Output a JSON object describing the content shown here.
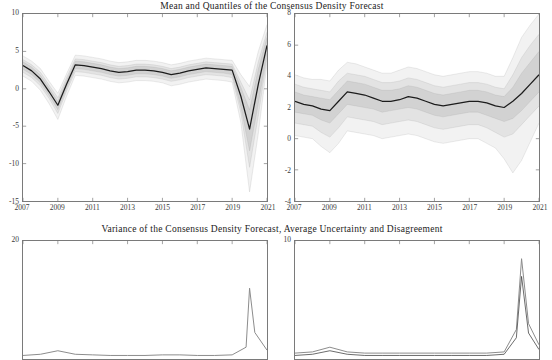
{
  "figure": {
    "title_top": "Mean and Quantiles of the Consensus Density Forecast",
    "title_bottom": "Variance of the Consensus Density Forecast, Average Uncertainty and Disagreement",
    "background": "#ffffff",
    "axis_color": "#7a7a7a",
    "line_color": "#1c1c1c",
    "band_colors": [
      "#f2f2f2",
      "#e3e3e3",
      "#d2d2d2",
      "#bfbfbf",
      "#ababab"
    ]
  },
  "chart_data": [
    {
      "id": "top-left",
      "type": "area",
      "title": "Mean and Quantiles of the Consensus Density Forecast",
      "xlabel": "",
      "ylabel": "",
      "xlim": [
        2007,
        2021
      ],
      "ylim": [
        -15,
        10
      ],
      "yticks": [
        -15,
        -10,
        -5,
        0,
        5,
        10
      ],
      "xticks": [
        2007,
        2009,
        2011,
        2013,
        2015,
        2017,
        2019,
        2021
      ],
      "grid": false,
      "legend": "none",
      "x": [
        2007,
        2007.5,
        2008,
        2008.5,
        2009,
        2009.5,
        2010,
        2010.5,
        2011,
        2011.5,
        2012,
        2012.5,
        2013,
        2013.5,
        2014,
        2014.5,
        2015,
        2015.5,
        2016,
        2016.5,
        2017,
        2017.5,
        2018,
        2018.5,
        2019,
        2019.5,
        2020,
        2020.5,
        2021
      ],
      "series": [
        {
          "name": "mean",
          "values": [
            3.1,
            2.4,
            1.3,
            -0.4,
            -2.2,
            0.6,
            3.2,
            3.1,
            2.9,
            2.7,
            2.4,
            2.2,
            2.3,
            2.5,
            2.5,
            2.4,
            2.2,
            1.9,
            2.1,
            2.4,
            2.6,
            2.8,
            2.7,
            2.6,
            2.5,
            -1.0,
            -5.4,
            0.6,
            5.8
          ]
        },
        {
          "name": "q05",
          "values": [
            1.7,
            1.0,
            -0.2,
            -2.0,
            -4.1,
            -1.0,
            1.8,
            1.7,
            1.5,
            1.3,
            1.0,
            0.8,
            0.9,
            1.1,
            1.1,
            1.0,
            0.8,
            0.4,
            0.6,
            0.9,
            1.1,
            1.3,
            1.2,
            1.1,
            0.9,
            -4.5,
            -13.8,
            -6.0,
            3.3
          ]
        },
        {
          "name": "q15",
          "values": [
            2.2,
            1.5,
            0.4,
            -1.3,
            -3.3,
            -0.3,
            2.3,
            2.2,
            2.0,
            1.8,
            1.5,
            1.3,
            1.4,
            1.6,
            1.6,
            1.5,
            1.3,
            1.0,
            1.2,
            1.5,
            1.7,
            1.9,
            1.8,
            1.7,
            1.5,
            -3.2,
            -10.5,
            -3.6,
            4.1
          ]
        },
        {
          "name": "q25",
          "values": [
            2.6,
            1.9,
            0.8,
            -0.9,
            -2.8,
            0.1,
            2.7,
            2.6,
            2.4,
            2.2,
            1.9,
            1.7,
            1.8,
            2.0,
            2.0,
            1.9,
            1.7,
            1.4,
            1.6,
            1.9,
            2.1,
            2.3,
            2.2,
            2.1,
            1.9,
            -2.4,
            -8.3,
            -2.0,
            4.7
          ]
        },
        {
          "name": "q75",
          "values": [
            3.6,
            2.9,
            1.8,
            0.1,
            -1.7,
            1.1,
            3.7,
            3.6,
            3.4,
            3.2,
            2.9,
            2.7,
            2.8,
            3.0,
            3.0,
            2.9,
            2.7,
            2.4,
            2.6,
            2.9,
            3.1,
            3.3,
            3.2,
            3.1,
            3.0,
            0.2,
            -2.8,
            2.6,
            6.9
          ]
        },
        {
          "name": "q85",
          "values": [
            3.9,
            3.2,
            2.2,
            0.5,
            -1.2,
            1.5,
            4.0,
            3.9,
            3.7,
            3.5,
            3.2,
            3.0,
            3.1,
            3.3,
            3.3,
            3.2,
            3.0,
            2.7,
            2.9,
            3.2,
            3.4,
            3.6,
            3.5,
            3.4,
            3.3,
            0.9,
            -1.5,
            3.6,
            7.6
          ]
        },
        {
          "name": "q95",
          "values": [
            4.4,
            3.7,
            2.7,
            1.0,
            -0.6,
            2.0,
            4.5,
            4.4,
            4.2,
            4.0,
            3.7,
            3.5,
            3.6,
            3.8,
            3.8,
            3.7,
            3.5,
            3.2,
            3.4,
            3.7,
            3.9,
            4.1,
            4.0,
            3.9,
            3.8,
            1.9,
            0.3,
            5.0,
            8.6
          ]
        }
      ]
    },
    {
      "id": "top-right",
      "type": "area",
      "title": "Mean and Quantiles of the Consensus Density Forecast",
      "xlabel": "",
      "ylabel": "",
      "xlim": [
        2007,
        2021
      ],
      "ylim": [
        -4,
        8
      ],
      "yticks": [
        -4,
        -2,
        0,
        2,
        4,
        6,
        8
      ],
      "xticks": [
        2007,
        2009,
        2011,
        2013,
        2015,
        2017,
        2019,
        2021
      ],
      "grid": false,
      "legend": "none",
      "x": [
        2007,
        2007.5,
        2008,
        2008.5,
        2009,
        2009.5,
        2010,
        2010.5,
        2011,
        2011.5,
        2012,
        2012.5,
        2013,
        2013.5,
        2014,
        2014.5,
        2015,
        2015.5,
        2016,
        2016.5,
        2017,
        2017.5,
        2018,
        2018.5,
        2019,
        2019.5,
        2020,
        2020.5,
        2021
      ],
      "series": [
        {
          "name": "mean",
          "values": [
            2.4,
            2.2,
            2.1,
            1.9,
            1.8,
            2.4,
            3.0,
            2.9,
            2.8,
            2.6,
            2.4,
            2.4,
            2.5,
            2.7,
            2.6,
            2.4,
            2.2,
            2.1,
            2.2,
            2.3,
            2.4,
            2.4,
            2.3,
            2.1,
            2.0,
            2.4,
            2.9,
            3.5,
            4.1
          ]
        },
        {
          "name": "q05",
          "values": [
            0.2,
            0.1,
            0.0,
            -0.5,
            -0.9,
            -0.3,
            0.5,
            0.4,
            0.3,
            0.2,
            0.0,
            0.1,
            0.2,
            0.3,
            0.2,
            0.0,
            -0.2,
            -0.3,
            -0.2,
            -0.1,
            0.0,
            0.0,
            -0.3,
            -0.6,
            -1.3,
            -2.2,
            -1.4,
            -0.2,
            1.0
          ]
        },
        {
          "name": "q15",
          "values": [
            1.0,
            0.9,
            0.8,
            0.4,
            0.1,
            0.7,
            1.4,
            1.3,
            1.2,
            1.1,
            0.9,
            1.0,
            1.1,
            1.2,
            1.1,
            0.9,
            0.7,
            0.6,
            0.7,
            0.8,
            0.9,
            0.9,
            0.7,
            0.4,
            0.1,
            0.3,
            0.9,
            1.5,
            2.1
          ]
        },
        {
          "name": "q25",
          "values": [
            1.7,
            1.6,
            1.5,
            1.2,
            1.0,
            1.6,
            2.2,
            2.1,
            2.0,
            1.9,
            1.7,
            1.8,
            1.9,
            2.0,
            1.9,
            1.7,
            1.5,
            1.4,
            1.5,
            1.6,
            1.7,
            1.7,
            1.5,
            1.3,
            1.1,
            1.3,
            1.8,
            2.4,
            3.0
          ]
        },
        {
          "name": "q75",
          "values": [
            3.0,
            2.8,
            2.7,
            2.6,
            2.5,
            3.1,
            3.7,
            3.6,
            3.5,
            3.3,
            3.1,
            3.1,
            3.2,
            3.4,
            3.3,
            3.1,
            2.9,
            2.8,
            2.9,
            3.0,
            3.1,
            3.1,
            3.0,
            2.8,
            2.7,
            3.3,
            4.2,
            4.9,
            5.6
          ]
        },
        {
          "name": "q85",
          "values": [
            3.5,
            3.3,
            3.2,
            3.1,
            3.0,
            3.7,
            4.2,
            4.1,
            4.0,
            3.8,
            3.6,
            3.6,
            3.7,
            3.9,
            3.8,
            3.6,
            3.4,
            3.3,
            3.4,
            3.5,
            3.6,
            3.6,
            3.5,
            3.3,
            3.2,
            4.1,
            5.2,
            6.0,
            6.7
          ]
        },
        {
          "name": "q95",
          "values": [
            4.1,
            3.9,
            3.8,
            3.8,
            3.7,
            4.4,
            4.9,
            4.8,
            4.6,
            4.4,
            4.2,
            4.2,
            4.4,
            4.6,
            4.5,
            4.3,
            4.1,
            4.0,
            4.1,
            4.2,
            4.3,
            4.3,
            4.2,
            4.0,
            4.0,
            5.2,
            6.5,
            7.3,
            8.0
          ]
        }
      ]
    },
    {
      "id": "bottom-left",
      "type": "line",
      "title": "Variance of the Consensus Density Forecast, Average Uncertainty and Disagreement",
      "xlabel": "",
      "ylabel": "",
      "xlim": [
        2007,
        2021
      ],
      "ylim": [
        0,
        20
      ],
      "yticks": [
        20
      ],
      "xticks": [],
      "grid": false,
      "legend": "none",
      "x": [
        2007,
        2008,
        2009,
        2010,
        2011,
        2012,
        2013,
        2014,
        2015,
        2016,
        2017,
        2018,
        2019,
        2019.8,
        2020,
        2020.3,
        2021
      ],
      "series": [
        {
          "name": "variance",
          "values": [
            0.6,
            0.8,
            1.4,
            0.8,
            0.7,
            0.6,
            0.6,
            0.6,
            0.7,
            0.7,
            0.6,
            0.6,
            0.7,
            2.0,
            12.0,
            4.5,
            1.5
          ]
        }
      ]
    },
    {
      "id": "bottom-right",
      "type": "line",
      "title": "Variance of the Consensus Density Forecast, Average Uncertainty and Disagreement",
      "xlabel": "",
      "ylabel": "",
      "xlim": [
        2007,
        2021
      ],
      "ylim": [
        0,
        10
      ],
      "yticks": [
        10
      ],
      "xticks": [],
      "grid": false,
      "legend": "none",
      "x": [
        2007,
        2008,
        2009,
        2010,
        2011,
        2012,
        2013,
        2014,
        2015,
        2016,
        2017,
        2018,
        2019,
        2019.7,
        2020,
        2020.4,
        2021
      ],
      "series": [
        {
          "name": "uncertainty",
          "values": [
            0.5,
            0.6,
            1.0,
            0.6,
            0.5,
            0.5,
            0.5,
            0.5,
            0.5,
            0.5,
            0.5,
            0.5,
            0.6,
            2.5,
            8.5,
            3.0,
            1.2
          ]
        },
        {
          "name": "disagreement",
          "values": [
            0.3,
            0.4,
            0.7,
            0.4,
            0.3,
            0.3,
            0.3,
            0.3,
            0.3,
            0.3,
            0.3,
            0.3,
            0.4,
            1.8,
            7.0,
            2.2,
            0.8
          ]
        }
      ]
    }
  ],
  "axes": {
    "top_left": {
      "yticks": [
        "10",
        "5",
        "0",
        "-5",
        "-10",
        "-15"
      ],
      "xticks": [
        "2007",
        "2009",
        "2011",
        "2013",
        "2015",
        "2017",
        "2019",
        "2021"
      ]
    },
    "top_right": {
      "yticks": [
        "8",
        "6",
        "4",
        "2",
        "0",
        "-2",
        "-4"
      ],
      "xticks": [
        "2007",
        "2009",
        "2011",
        "2013",
        "2015",
        "2017",
        "2019",
        "2021"
      ]
    },
    "bottom_left": {
      "yticks": [
        "20"
      ],
      "xticks": []
    },
    "bottom_right": {
      "yticks": [
        "10"
      ],
      "xticks": []
    }
  }
}
